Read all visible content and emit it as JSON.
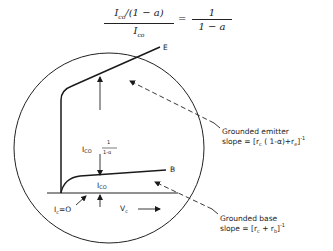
{
  "equation": {
    "lhs_numerator": "Ico/(1 − a)",
    "lhs_numerator_parts": {
      "I": "I",
      "sub": "co",
      "rest": "/(1 − a)"
    },
    "lhs_denominator_parts": {
      "I": "I",
      "sub": "co"
    },
    "equals": "=",
    "rhs_numerator": "1",
    "rhs_denominator": "1 − a"
  },
  "diagram": {
    "curve_E_label": "E",
    "curve_B_label": "B",
    "gap_label_main": "I",
    "gap_label_sub": "CO",
    "gap_fraction_num": "1",
    "gap_fraction_den": "1-α",
    "base_label_main": "I",
    "base_label_sub": "CO",
    "ic_zero_label": "I",
    "ic_zero_sub": "c",
    "ic_zero_value": "=O",
    "vc_label": "V",
    "vc_sub": "c",
    "emitter_annotation": {
      "line1": "Grounded emitter",
      "line2": "slope = [rc ( 1-α)+re] -1",
      "line2_parts": {
        "pre": "slope = [r",
        "sub1": "c",
        "mid": " ( 1-α)+r",
        "sub2": "e",
        "post": "]",
        "exp": "-1"
      }
    },
    "base_annotation": {
      "line1": "Grounded base",
      "line2": "slope = [rc + rb] -1",
      "line2_parts": {
        "pre": "slope = [r",
        "sub1": "c",
        "mid": " + r",
        "sub2": "b",
        "post": "]",
        "exp": "-1"
      }
    }
  }
}
